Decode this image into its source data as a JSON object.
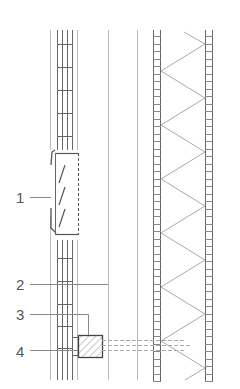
{
  "figure": {
    "type": "wall-section-detail",
    "colors": {
      "line_dark": "#555555",
      "line_mid": "#888888",
      "line_light": "#bbbbbb",
      "hatch": "#999999",
      "background": "#ffffff"
    }
  },
  "labels": [
    {
      "id": "1",
      "text": "1",
      "x": 16,
      "y": 202
    },
    {
      "id": "2",
      "text": "2",
      "x": 16,
      "y": 290
    },
    {
      "id": "3",
      "text": "3",
      "x": 16,
      "y": 320
    },
    {
      "id": "4",
      "text": "4",
      "x": 16,
      "y": 356
    }
  ]
}
